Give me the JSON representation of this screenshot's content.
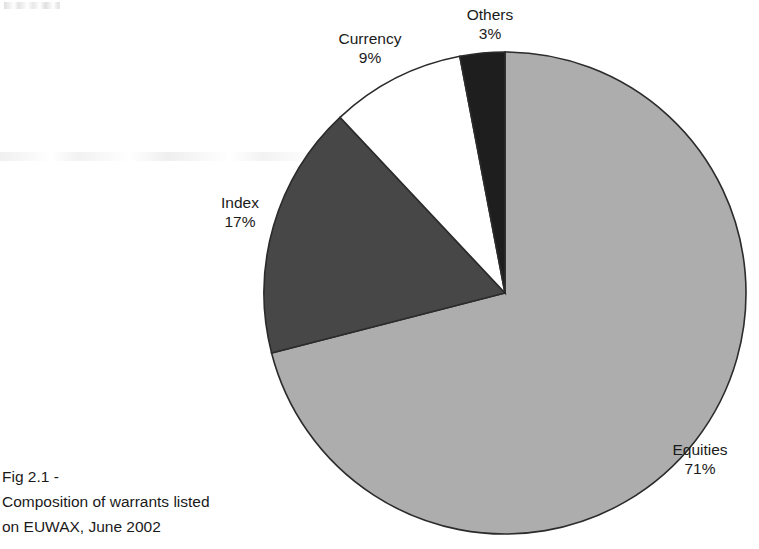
{
  "figure": {
    "caption_lines": [
      "Fig 2.1 -",
      "Composition of warrants listed",
      "on EUWAX, June 2002"
    ]
  },
  "chart_data": {
    "type": "pie",
    "title": "Composition of warrants listed on EUWAX, June 2002",
    "xlabel": "",
    "ylabel": "",
    "legend_position": "none",
    "grid": false,
    "labels_outside": true,
    "start_angle_deg": 0,
    "direction": "clockwise",
    "categories": [
      "Equities",
      "Index",
      "Currency",
      "Others"
    ],
    "values": [
      71,
      17,
      9,
      3
    ],
    "unit": "%",
    "slices": [
      {
        "name": "Equities",
        "value": 71,
        "value_label": "71%",
        "color": "#adadad",
        "start_deg": 0,
        "end_deg": 255.6
      },
      {
        "name": "Index",
        "value": 17,
        "value_label": "17%",
        "color": "#474747",
        "start_deg": 255.6,
        "end_deg": 316.8
      },
      {
        "name": "Currency",
        "value": 9,
        "value_label": "9%",
        "color": "#ffffff",
        "start_deg": 316.8,
        "end_deg": 349.2
      },
      {
        "name": "Others",
        "value": 3,
        "value_label": "3%",
        "color": "#1e1e1e",
        "start_deg": 349.2,
        "end_deg": 360
      }
    ],
    "outline_color": "#2b2b2b",
    "background": "#ffffff"
  }
}
